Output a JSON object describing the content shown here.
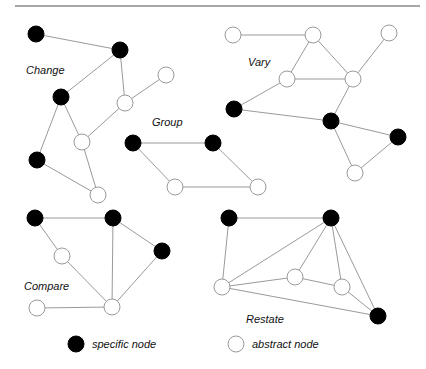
{
  "legend": {
    "specific": "specific node",
    "abstract": "abstract node"
  },
  "colors": {
    "specific": "#000000",
    "abstract": "#ffffff",
    "edge": "#9a9a9a"
  },
  "groups": [
    {
      "label": "Change",
      "label_pos": [
        26,
        74
      ],
      "nodes": [
        [
          36,
          34,
          "b"
        ],
        [
          120,
          50,
          "b"
        ],
        [
          61,
          97,
          "b"
        ],
        [
          166,
          75,
          "w"
        ],
        [
          125,
          103,
          "w"
        ],
        [
          82,
          142,
          "w"
        ],
        [
          37,
          160,
          "b"
        ],
        [
          98,
          195,
          "w"
        ]
      ],
      "edges": [
        [
          0,
          1
        ],
        [
          1,
          2
        ],
        [
          1,
          4
        ],
        [
          4,
          3
        ],
        [
          4,
          5
        ],
        [
          2,
          5
        ],
        [
          2,
          6
        ],
        [
          6,
          7
        ],
        [
          5,
          7
        ]
      ]
    },
    {
      "label": "Vary",
      "label_pos": [
        248,
        66
      ],
      "nodes": [
        [
          233,
          35,
          "w"
        ],
        [
          313,
          35,
          "w"
        ],
        [
          389,
          33,
          "w"
        ],
        [
          287,
          79,
          "w"
        ],
        [
          353,
          79,
          "w"
        ],
        [
          234,
          109,
          "b"
        ],
        [
          331,
          121,
          "b"
        ],
        [
          398,
          137,
          "b"
        ],
        [
          355,
          173,
          "w"
        ]
      ],
      "edges": [
        [
          0,
          1
        ],
        [
          1,
          3
        ],
        [
          1,
          4
        ],
        [
          3,
          4
        ],
        [
          2,
          4
        ],
        [
          3,
          5
        ],
        [
          4,
          6
        ],
        [
          5,
          6
        ],
        [
          6,
          7
        ],
        [
          6,
          8
        ],
        [
          7,
          8
        ]
      ]
    },
    {
      "label": "Group",
      "label_pos": [
        152,
        126
      ],
      "nodes": [
        [
          133,
          143,
          "b"
        ],
        [
          213,
          143,
          "b"
        ],
        [
          175,
          187,
          "w"
        ],
        [
          258,
          187,
          "w"
        ]
      ],
      "edges": [
        [
          0,
          1
        ],
        [
          0,
          2
        ],
        [
          2,
          3
        ],
        [
          1,
          3
        ]
      ]
    },
    {
      "label": "Compare",
      "label_pos": [
        24,
        290
      ],
      "nodes": [
        [
          35,
          218,
          "b"
        ],
        [
          113,
          218,
          "b"
        ],
        [
          162,
          251,
          "b"
        ],
        [
          62,
          256,
          "w"
        ],
        [
          112,
          307,
          "w"
        ],
        [
          37,
          308,
          "w"
        ]
      ],
      "edges": [
        [
          0,
          1
        ],
        [
          0,
          3
        ],
        [
          1,
          2
        ],
        [
          1,
          4
        ],
        [
          3,
          4
        ],
        [
          2,
          4
        ],
        [
          5,
          4
        ]
      ]
    },
    {
      "label": "Restate",
      "label_pos": [
        246,
        323
      ],
      "nodes": [
        [
          229,
          218,
          "b"
        ],
        [
          331,
          218,
          "b"
        ],
        [
          222,
          287,
          "w"
        ],
        [
          295,
          277,
          "w"
        ],
        [
          342,
          287,
          "w"
        ],
        [
          378,
          316,
          "b"
        ]
      ],
      "edges": [
        [
          0,
          1
        ],
        [
          0,
          2
        ],
        [
          1,
          2
        ],
        [
          1,
          3
        ],
        [
          1,
          4
        ],
        [
          1,
          5
        ],
        [
          2,
          3
        ],
        [
          3,
          4
        ],
        [
          2,
          5
        ],
        [
          4,
          5
        ]
      ]
    }
  ]
}
